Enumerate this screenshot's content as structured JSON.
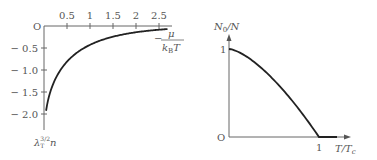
{
  "chart_data": [
    {
      "type": "line",
      "title": "",
      "xlabel": "-μ/(k_B T)",
      "xlabel_parts": {
        "minus": "−",
        "numerator": "μ",
        "denominator": "k",
        "denominator_sub": "B",
        "denominator_tail": "T"
      },
      "ylabel": "λ_T^{3/2} n",
      "ylabel_parts": {
        "base": "λ",
        "sub": "T",
        "sup": "3/2",
        "tail": "n"
      },
      "origin_label": "O",
      "xlim": [
        0,
        2.7
      ],
      "ylim": [
        -2.35,
        0
      ],
      "xticks": [
        0.5,
        1,
        1.5,
        2,
        2.5
      ],
      "xtick_labels": [
        "0.5",
        "1",
        "1.5",
        "2",
        "2.5"
      ],
      "yticks": [
        -0.5,
        -1.0,
        -1.5,
        -2.0
      ],
      "ytick_labels": [
        "− 0.5",
        "− 1.0",
        "− 1.5",
        "− 2.0"
      ],
      "grid": false,
      "series": [
        {
          "name": "-g_{3/2}(e^{μ/k_B T})",
          "x": [
            0.05,
            0.1,
            0.2,
            0.3,
            0.5,
            0.75,
            1.0,
            1.25,
            1.5,
            2.0,
            2.5,
            2.7
          ],
          "y": [
            -2.24,
            -2.06,
            -1.68,
            -1.38,
            -0.81,
            -0.59,
            -0.43,
            -0.32,
            -0.24,
            -0.14,
            -0.08,
            -0.07
          ]
        }
      ]
    },
    {
      "type": "line",
      "title": "",
      "xlabel": "T/T_c",
      "xlabel_parts": {
        "main": "T/T",
        "sub": "c"
      },
      "ylabel": "N_0/N",
      "ylabel_parts": {
        "main": "N",
        "sub": "0",
        "tail": "/N"
      },
      "origin_label": "O",
      "xlim": [
        0,
        1.35
      ],
      "ylim": [
        0,
        1.15
      ],
      "xticks": [
        1
      ],
      "xtick_labels": [
        "1"
      ],
      "yticks": [
        1
      ],
      "ytick_labels": [
        "1"
      ],
      "grid": false,
      "series": [
        {
          "name": "1-(T/T_c)^{3/2}",
          "x": [
            0,
            0.1,
            0.2,
            0.3,
            0.4,
            0.5,
            0.6,
            0.7,
            0.8,
            0.9,
            1.0,
            1.2
          ],
          "y": [
            1,
            0.968,
            0.911,
            0.836,
            0.747,
            0.646,
            0.535,
            0.414,
            0.284,
            0.146,
            0,
            0
          ]
        }
      ]
    }
  ]
}
